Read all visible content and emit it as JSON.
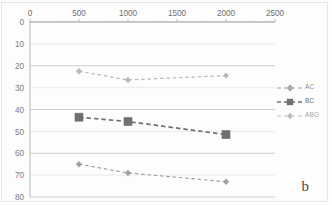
{
  "figure": {
    "panel_label": "b",
    "background_color": "#fdfdfd",
    "frame_color": "#e6e6e6"
  },
  "chart_data": {
    "type": "line",
    "title": "",
    "subtitle": "",
    "xlabel": "",
    "ylabel": "",
    "x": [
      500,
      1000,
      2000
    ],
    "xlim": [
      0,
      2500
    ],
    "ylim": [
      0,
      80
    ],
    "y_axis_inverted": true,
    "x_axis_position": "top",
    "grid": true,
    "grid_axis": "y",
    "legend_position": "right",
    "xticks": [
      "0",
      "500",
      "1000",
      "1500",
      "2000",
      "2500"
    ],
    "xtick_values": [
      0,
      500,
      1000,
      1500,
      2000,
      2500
    ],
    "yticks": [
      "0",
      "10",
      "20",
      "30",
      "40",
      "50",
      "60",
      "70",
      "80"
    ],
    "ytick_values": [
      0,
      10,
      20,
      30,
      40,
      50,
      60,
      70,
      80
    ],
    "series": [
      {
        "name": "AC",
        "values": [
          65,
          69,
          73
        ],
        "color": "#9a9a9a",
        "marker": "diamond",
        "linestyle": "dashed"
      },
      {
        "name": "BC",
        "values": [
          43.5,
          45.5,
          51.5
        ],
        "color": "#707070",
        "marker": "square",
        "linestyle": "dashed"
      },
      {
        "name": "ABG",
        "values": [
          22.5,
          26.5,
          24.5
        ],
        "color": "#b4b4b4",
        "marker": "diamond",
        "linestyle": "dashed"
      }
    ],
    "annotations": [
      {
        "text": "b",
        "position": "bottom-right"
      }
    ]
  },
  "legend": {
    "entries": [
      {
        "label": "AC"
      },
      {
        "label": "BC"
      },
      {
        "label": "ABG"
      }
    ]
  }
}
